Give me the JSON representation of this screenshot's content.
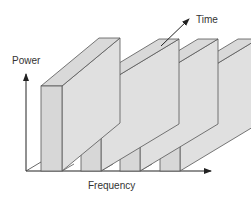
{
  "diagram": {
    "labels": {
      "power": "Power",
      "time": "Time",
      "frequency": "Frequency"
    },
    "colors": {
      "face_front": "#d7d7d7",
      "face_side": "#e0e0e0",
      "face_top": "#d9d9d9",
      "stroke": "#555555",
      "axis": "#222222"
    },
    "blocks": [
      {
        "name": "channel-1"
      },
      {
        "name": "channel-2"
      },
      {
        "name": "channel-3"
      },
      {
        "name": "channel-4"
      }
    ]
  }
}
